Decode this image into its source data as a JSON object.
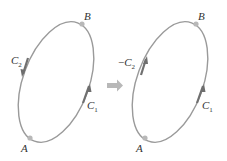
{
  "figure": {
    "left_panel": {
      "points": {
        "start": "A",
        "end": "B"
      },
      "curves": [
        {
          "label": "C",
          "subscript": "1",
          "prefix": "",
          "direction": "A to B (upward on right side)"
        },
        {
          "label": "C",
          "subscript": "2",
          "prefix": "",
          "direction": "B to A (downward on left side)"
        }
      ]
    },
    "right_panel": {
      "points": {
        "start": "A",
        "end": "B"
      },
      "curves": [
        {
          "label": "C",
          "subscript": "1",
          "prefix": "",
          "direction": "A to B (upward on right side)"
        },
        {
          "label": "C",
          "subscript": "2",
          "prefix": "−",
          "direction": "A to B (upward on left side)"
        }
      ]
    },
    "transition_arrow": "right-arrow",
    "colors": {
      "curve": "#9a9a9a",
      "arrow_head": "#6e6e6e",
      "point": "#b8b8b8",
      "transition_arrow": "#b8b8b8",
      "text": "#333333"
    }
  }
}
